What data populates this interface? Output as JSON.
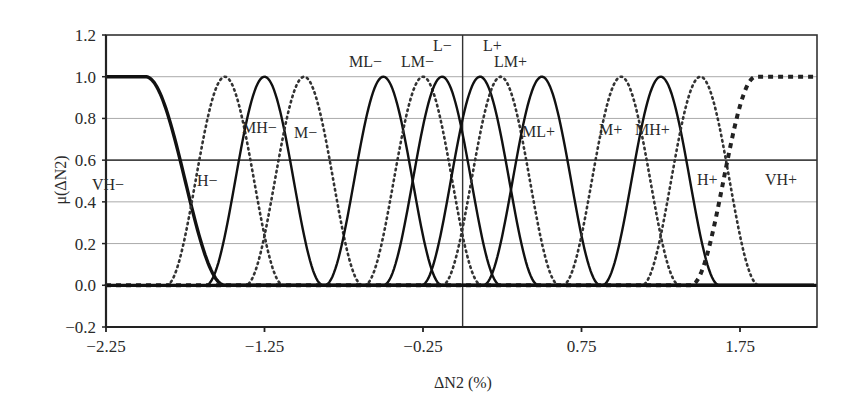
{
  "chart_data": {
    "type": "line",
    "title": "",
    "xlabel": "ΔN2 (%)",
    "ylabel": "μ(ΔN2)",
    "xlim": [
      -2.25,
      2.23
    ],
    "ylim": [
      -0.2,
      1.2
    ],
    "x_ticks": [
      -2.25,
      -1.25,
      -0.25,
      0.75,
      1.75
    ],
    "x_tick_labels": [
      "−2.25",
      "−1.25",
      "−0.25",
      "0.75",
      "1.75"
    ],
    "y_ticks": [
      -0.2,
      0.0,
      0.2,
      0.4,
      0.6,
      0.8,
      1.0,
      1.2
    ],
    "y_tick_labels": [
      "−0.2",
      "0.0",
      "0.2",
      "0.4",
      "0.6",
      "0.8",
      "1.0",
      "1.2"
    ],
    "grid": "horizontal",
    "vertical_reference_line_x": 0.0,
    "legend": "none (labels placed inline)",
    "series": [
      {
        "name": "VH−",
        "shape": "z",
        "style": "solid-thick",
        "shoulder": -2.0,
        "zero": -1.5
      },
      {
        "name": "H−",
        "shape": "bell",
        "style": "dotted",
        "peak": -1.5,
        "halfwidth": 0.37
      },
      {
        "name": "MH−",
        "shape": "bell",
        "style": "solid",
        "peak": -1.25,
        "halfwidth": 0.37
      },
      {
        "name": "M−",
        "shape": "bell",
        "style": "dotted",
        "peak": -1.0,
        "halfwidth": 0.37
      },
      {
        "name": "ML−",
        "shape": "bell",
        "style": "solid",
        "peak": -0.5,
        "halfwidth": 0.37
      },
      {
        "name": "LM−",
        "shape": "bell",
        "style": "dotted",
        "peak": -0.25,
        "halfwidth": 0.37
      },
      {
        "name": "L−",
        "shape": "bell",
        "style": "solid",
        "peak": -0.13,
        "halfwidth": 0.37
      },
      {
        "name": "L+",
        "shape": "bell",
        "style": "solid",
        "peak": 0.11,
        "halfwidth": 0.37
      },
      {
        "name": "LM+",
        "shape": "bell",
        "style": "dotted",
        "peak": 0.24,
        "halfwidth": 0.37
      },
      {
        "name": "ML+",
        "shape": "bell",
        "style": "solid",
        "peak": 0.5,
        "halfwidth": 0.37
      },
      {
        "name": "M+",
        "shape": "bell",
        "style": "dotted",
        "peak": 1.0,
        "halfwidth": 0.37
      },
      {
        "name": "MH+",
        "shape": "bell",
        "style": "solid",
        "peak": 1.25,
        "halfwidth": 0.37
      },
      {
        "name": "H+",
        "shape": "bell",
        "style": "dotted",
        "peak": 1.5,
        "halfwidth": 0.37
      },
      {
        "name": "VH+",
        "shape": "s",
        "style": "dashed-thick",
        "zero": 1.44,
        "shoulder": 1.85
      }
    ],
    "annotations": [
      {
        "text": "VH−",
        "x": 92,
        "y": 190
      },
      {
        "text": "H−",
        "x": 197,
        "y": 186
      },
      {
        "text": "MH−",
        "x": 242,
        "y": 133
      },
      {
        "text": "M−",
        "x": 294,
        "y": 138
      },
      {
        "text": "ML−",
        "x": 349,
        "y": 67
      },
      {
        "text": "LM−",
        "x": 401,
        "y": 67
      },
      {
        "text": "L−",
        "x": 433,
        "y": 51
      },
      {
        "text": "L+",
        "x": 483,
        "y": 51
      },
      {
        "text": "LM+",
        "x": 494,
        "y": 67
      },
      {
        "text": "ML+",
        "x": 522,
        "y": 137
      },
      {
        "text": "M+",
        "x": 599,
        "y": 135
      },
      {
        "text": "MH+",
        "x": 635,
        "y": 135
      },
      {
        "text": "H+",
        "x": 697,
        "y": 185
      },
      {
        "text": "VH+",
        "x": 765,
        "y": 185
      }
    ]
  }
}
